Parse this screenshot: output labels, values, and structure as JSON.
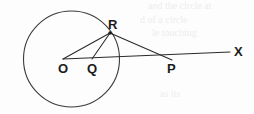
{
  "figure": {
    "background_color": "#fdfdfd",
    "ink_color": "#2a2a2a",
    "width": 254,
    "height": 114,
    "circle": {
      "name": "main-circle",
      "center_label": "O",
      "cx": 71.5,
      "cy": 59,
      "r": 48
    },
    "points": [
      {
        "id": "O",
        "label": "O",
        "x": 63,
        "y": 59,
        "label_x": 58,
        "label_y": 62,
        "dot": false
      },
      {
        "id": "Q",
        "label": "Q",
        "x": 92,
        "y": 59,
        "label_x": 87,
        "label_y": 62,
        "dot": false
      },
      {
        "id": "R",
        "label": "R",
        "x": 110,
        "y": 33,
        "label_x": 108,
        "label_y": 18,
        "dot": true
      },
      {
        "id": "P",
        "label": "P",
        "x": 172,
        "y": 60,
        "label_x": 167,
        "label_y": 62,
        "dot": false
      },
      {
        "id": "X",
        "label": "X",
        "x": 230,
        "y": 52,
        "label_x": 234,
        "label_y": 45,
        "dot": false
      }
    ],
    "segments": [
      {
        "name": "segment-O-R",
        "from": "O",
        "to": "R"
      },
      {
        "name": "segment-Q-R",
        "from": "Q",
        "to": "R"
      },
      {
        "name": "segment-R-P",
        "from": "R",
        "to": "P"
      },
      {
        "name": "ray-O-to-X",
        "from": "O",
        "to": "X"
      }
    ],
    "bleed_text": [
      {
        "text": "and the circle at",
        "x": 148,
        "y": 4,
        "opacity": 0.55
      },
      {
        "text": "d  of  a  circle",
        "x": 140,
        "y": 18,
        "opacity": 0.5
      },
      {
        "text": "le  touching",
        "x": 152,
        "y": 31,
        "opacity": 0.45
      },
      {
        "text": "as its",
        "x": 160,
        "y": 92,
        "opacity": 0.4
      }
    ]
  }
}
